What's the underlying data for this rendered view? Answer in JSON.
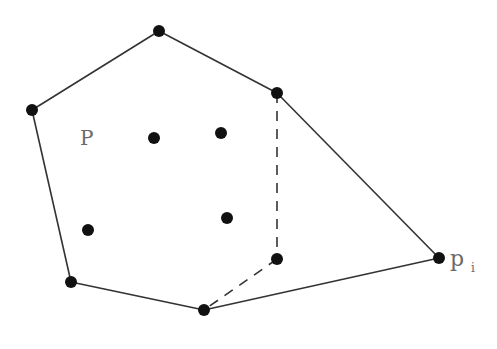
{
  "diagram": {
    "colors": {
      "background": "#ffffff",
      "edge": "#333333",
      "point": "#111111",
      "label": "#6a6a6a"
    },
    "labels": {
      "set_label": "P",
      "new_point_label": "p",
      "new_point_subscript": "i"
    },
    "hull_points": [
      {
        "id": "h1",
        "x": 32,
        "y": 110
      },
      {
        "id": "h2",
        "x": 159,
        "y": 31
      },
      {
        "id": "h3",
        "x": 277,
        "y": 93
      },
      {
        "id": "h4",
        "x": 439,
        "y": 258
      },
      {
        "id": "h5",
        "x": 204,
        "y": 310
      },
      {
        "id": "h6",
        "x": 71,
        "y": 282
      }
    ],
    "interior_points": [
      {
        "id": "i1",
        "x": 154,
        "y": 138
      },
      {
        "id": "i2",
        "x": 221,
        "y": 133
      },
      {
        "id": "i3",
        "x": 88,
        "y": 230
      },
      {
        "id": "i4",
        "x": 227,
        "y": 218
      },
      {
        "id": "i5",
        "x": 277,
        "y": 259
      }
    ],
    "solid_edges": [
      [
        "h1",
        "h2"
      ],
      [
        "h2",
        "h3"
      ],
      [
        "h3",
        "h4"
      ],
      [
        "h4",
        "h5"
      ],
      [
        "h5",
        "h6"
      ],
      [
        "h6",
        "h1"
      ]
    ],
    "dashed_edges": [
      [
        "h3",
        "i5"
      ],
      [
        "i5",
        "h5"
      ]
    ]
  }
}
